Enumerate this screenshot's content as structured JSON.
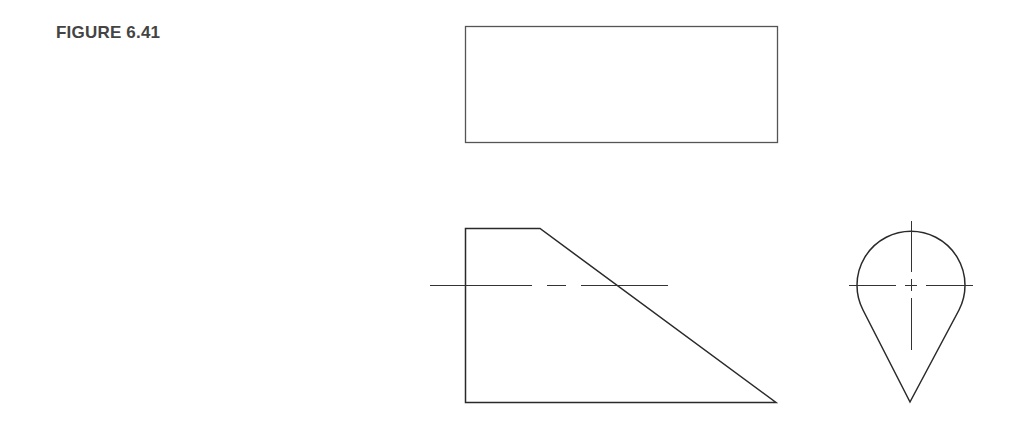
{
  "figure": {
    "label": "FIGURE 6.41"
  },
  "views": {
    "top_view": {
      "name": "Top view",
      "shape": "rectangle",
      "x": 465,
      "y": 26,
      "width": 312,
      "height": 116
    },
    "front_view": {
      "name": "Front view",
      "shape": "trapezoid",
      "points": [
        [
          465,
          228
        ],
        [
          540,
          228
        ],
        [
          776,
          402
        ],
        [
          465,
          402
        ]
      ],
      "centerline": {
        "y": 285,
        "segments": [
          [
            430,
            532
          ],
          [
            547,
            566
          ],
          [
            581,
            668
          ]
        ]
      }
    },
    "side_view": {
      "name": "Right side view",
      "shape": "teardrop",
      "circle_center": [
        911,
        285
      ],
      "radius": 54,
      "tip": [
        910,
        402
      ],
      "tangent_left": [
        863,
        310
      ],
      "tangent_right": [
        959,
        310
      ],
      "centerline_horizontal": {
        "y": 285,
        "segments": [
          [
            849,
            896
          ],
          [
            905,
            917
          ],
          [
            926,
            973
          ]
        ]
      },
      "centerline_vertical": {
        "x": 911,
        "segments": [
          [
            221,
            272
          ],
          [
            279,
            291
          ],
          [
            298,
            350
          ]
        ]
      }
    }
  },
  "colors": {
    "stroke": "#2a2a2a",
    "label": "#444444",
    "background": "#ffffff"
  }
}
